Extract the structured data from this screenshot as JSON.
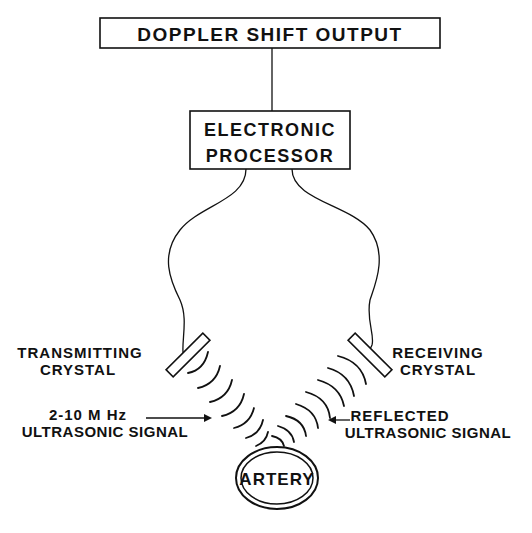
{
  "diagram": {
    "title_box": {
      "label": "DOPPLER SHIFT OUTPUT"
    },
    "processor_box": {
      "line1": "ELECTRONIC",
      "line2": "PROCESSOR"
    },
    "transmitting_crystal": {
      "line1": "TRANSMITTING",
      "line2": "CRYSTAL"
    },
    "receiving_crystal": {
      "line1": "RECEIVING",
      "line2": "CRYSTAL"
    },
    "incident_signal": {
      "line1": "2-10 M Hz",
      "line2": "ULTRASONIC SIGNAL"
    },
    "reflected_signal": {
      "line1": "REFLECTED",
      "line2": "ULTRASONIC SIGNAL"
    },
    "vessel": {
      "label": "ARTERY"
    },
    "colors": {
      "ink": "#111111",
      "background": "#ffffff"
    }
  }
}
